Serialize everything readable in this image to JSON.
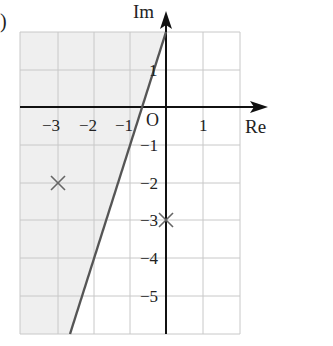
{
  "diagram": {
    "type": "argand-diagram",
    "axes": {
      "x_label": "Re",
      "y_label": "Im",
      "origin_label": "O",
      "x_ticks": [
        {
          "value": -3,
          "label": "−3"
        },
        {
          "value": -2,
          "label": "−2"
        },
        {
          "value": -1,
          "label": "−1"
        },
        {
          "value": 1,
          "label": "1"
        }
      ],
      "y_ticks": [
        {
          "value": 1,
          "label": "1"
        },
        {
          "value": -1,
          "label": "−1"
        },
        {
          "value": -2,
          "label": "−2"
        },
        {
          "value": -3,
          "label": "−3"
        },
        {
          "value": -4,
          "label": "−4"
        },
        {
          "value": -5,
          "label": "−5"
        }
      ],
      "x_range": [
        -4,
        2
      ],
      "y_range": [
        -6,
        2
      ]
    },
    "points": [
      {
        "re": -3,
        "im": -2,
        "marker": "cross"
      },
      {
        "re": 0,
        "im": -3,
        "marker": "cross"
      }
    ],
    "boundary_line": {
      "description": "perpendicular bisector of the two marked points",
      "from": {
        "re": 0,
        "im": 1.6
      },
      "to": {
        "re": -2.6,
        "im": -6
      }
    },
    "shaded_region": "left of boundary line",
    "corner_fragment": ")",
    "colors": {
      "shade": "#efefef",
      "grid": "#c8c8c8",
      "axis": "#111111",
      "line": "#555555",
      "marker": "#666666"
    }
  }
}
